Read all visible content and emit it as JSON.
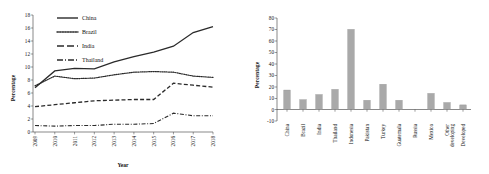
{
  "figure": {
    "panels": [
      "line-chart-trends",
      "bar-chart-shares"
    ]
  },
  "left_chart": {
    "ylabel": "Percentage",
    "xlabel": "Year",
    "legend": [
      {
        "label": "China",
        "style": "solid"
      },
      {
        "label": "Brazil",
        "style": "dotted"
      },
      {
        "label": "India",
        "style": "dashed"
      },
      {
        "label": "Thailand",
        "style": "dash-dot"
      }
    ],
    "yticks": [
      "0",
      "2",
      "4",
      "6",
      "8",
      "10",
      "12",
      "14",
      "16",
      "18"
    ],
    "xticks": [
      "2009",
      "2010",
      "2011",
      "2012",
      "2013",
      "2014",
      "2015",
      "2016",
      "2017",
      "2018"
    ]
  },
  "right_chart": {
    "ylabel": "Percentage",
    "yticks": [
      "-10",
      "0",
      "10",
      "20",
      "30",
      "40",
      "50",
      "60",
      "70",
      "80"
    ],
    "categories": [
      "China",
      "Brazil",
      "India",
      "Thailand",
      "Indonesia",
      "Pakistan",
      "Turkey",
      "Guatemala",
      "Russia",
      "Mexico",
      "Other developing",
      "Developed"
    ]
  },
  "chart_data": [
    {
      "type": "line",
      "title": "",
      "xlabel": "Year",
      "ylabel": "Percentage",
      "x": [
        2009,
        2010,
        2011,
        2012,
        2013,
        2014,
        2015,
        2016,
        2017,
        2018
      ],
      "ylim": [
        0,
        18
      ],
      "xlim": [
        2009,
        2018
      ],
      "grid": false,
      "legend_position": "top-center",
      "series": [
        {
          "name": "China",
          "style": "solid",
          "values": [
            6.8,
            9.4,
            9.8,
            9.7,
            10.8,
            11.6,
            12.3,
            13.2,
            15.3,
            16.2
          ]
        },
        {
          "name": "Brazil",
          "style": "dotted",
          "values": [
            7.1,
            8.6,
            8.2,
            8.3,
            8.8,
            9.2,
            9.3,
            9.2,
            8.6,
            8.4
          ]
        },
        {
          "name": "India",
          "style": "dashed",
          "values": [
            3.9,
            4.2,
            4.5,
            4.8,
            4.9,
            5.0,
            5.0,
            7.5,
            7.2,
            6.9
          ]
        },
        {
          "name": "Thailand",
          "style": "dash-dot",
          "values": [
            1.0,
            0.9,
            1.0,
            1.0,
            1.2,
            1.2,
            1.3,
            2.9,
            2.5,
            2.5
          ]
        }
      ]
    },
    {
      "type": "bar",
      "title": "",
      "xlabel": "",
      "ylabel": "Percentage",
      "categories": [
        "China",
        "Brazil",
        "India",
        "Thailand",
        "Indonesia",
        "Pakistan",
        "Turkey",
        "Guatemala",
        "Russia",
        "Mexico",
        "Other developing",
        "Developed"
      ],
      "values": [
        17,
        8.5,
        13,
        17.5,
        70,
        8,
        22,
        8,
        0,
        14,
        6,
        4
      ],
      "ylim": [
        -10,
        80
      ],
      "grid": false,
      "legend_position": "none"
    }
  ],
  "colors": {
    "bar_fill": "#a9a9a9",
    "bar_stroke": "#8c8c8c",
    "line": "#2a2a2a",
    "axis": "#3b3b3b",
    "background": "#ffffff"
  }
}
